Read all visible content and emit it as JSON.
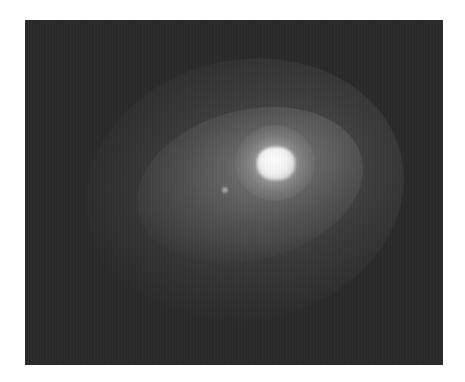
{
  "image": {
    "description": "Grayscale astronomical image of a diffuse glowing object with a bright saturated core and a faint secondary knot",
    "colors": {
      "background": "#ffffff",
      "sky": "#2a2a2a",
      "core": "#ffffff",
      "halo": "#7a7a7a"
    },
    "features": [
      {
        "name": "bright-core",
        "x": 275,
        "y": 163
      },
      {
        "name": "faint-knot",
        "x": 226,
        "y": 190
      }
    ]
  }
}
